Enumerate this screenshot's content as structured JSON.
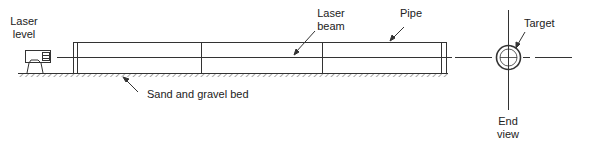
{
  "figure": {
    "labels": {
      "laser_level": [
        "Laser",
        "level"
      ],
      "laser_beam": [
        "Laser",
        "beam"
      ],
      "pipe": "Pipe",
      "bed": "Sand and gravel bed",
      "target": "Target",
      "end_view": [
        "End",
        "view"
      ]
    },
    "colors": {
      "line": "#333333",
      "background": "#ffffff"
    }
  }
}
